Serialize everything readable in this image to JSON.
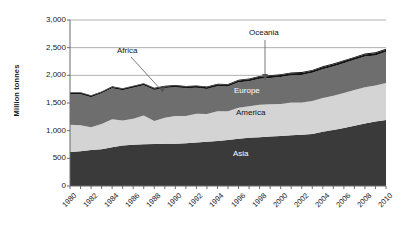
{
  "chart_data": {
    "type": "area",
    "stacked": true,
    "title": "",
    "xlabel": "",
    "ylabel": "Million tonnes",
    "ylim": [
      0,
      3000
    ],
    "ytick_labels": [
      "0",
      "500",
      "1,000",
      "1,500",
      "2,000",
      "2,500",
      "3,000"
    ],
    "ytick_values": [
      0,
      500,
      1000,
      1500,
      2000,
      2500,
      3000
    ],
    "grid": true,
    "grid_axis": "y",
    "legend_position": "inline-labels",
    "x": [
      1980,
      1981,
      1982,
      1983,
      1984,
      1985,
      1986,
      1987,
      1988,
      1989,
      1990,
      1991,
      1992,
      1993,
      1994,
      1995,
      1996,
      1997,
      1998,
      1999,
      2000,
      2001,
      2002,
      2003,
      2004,
      2005,
      2006,
      2007,
      2008,
      2009,
      2010
    ],
    "xtick_labels": [
      "1980",
      "1982",
      "1984",
      "1986",
      "1988",
      "1990",
      "1992",
      "1994",
      "1996",
      "1998",
      "2000",
      "2002",
      "2004",
      "2006",
      "2008",
      "2010"
    ],
    "xtick_values": [
      1980,
      1982,
      1984,
      1986,
      1988,
      1990,
      1992,
      1994,
      1996,
      1998,
      2000,
      2002,
      2004,
      2006,
      2008,
      2010
    ],
    "xlim": [
      1980,
      2010
    ],
    "series": [
      {
        "name": "Asia",
        "color": "#3a3a3a",
        "label_position": "inline",
        "values": [
          615,
          630,
          650,
          665,
          700,
          730,
          745,
          755,
          760,
          762,
          765,
          772,
          785,
          800,
          812,
          830,
          855,
          870,
          880,
          893,
          905,
          918,
          928,
          942,
          980,
          1010,
          1050,
          1090,
          1130,
          1165,
          1195
        ]
      },
      {
        "name": "America",
        "color": "#d4d4d4",
        "label_position": "inline",
        "values": [
          490,
          470,
          410,
          455,
          505,
          455,
          470,
          520,
          415,
          470,
          500,
          495,
          520,
          500,
          540,
          520,
          560,
          570,
          590,
          585,
          575,
          590,
          580,
          595,
          610,
          620,
          630,
          645,
          655,
          650,
          665
        ]
      },
      {
        "name": "Europe",
        "color": "#6e6e6e",
        "label_position": "inline",
        "values": [
          555,
          560,
          545,
          555,
          560,
          545,
          560,
          545,
          560,
          540,
          520,
          500,
          470,
          455,
          450,
          450,
          460,
          455,
          470,
          475,
          490,
          495,
          500,
          510,
          520,
          530,
          540,
          545,
          555,
          545,
          565
        ]
      },
      {
        "name": "Africa",
        "color": "#141414",
        "label_position": "callout",
        "values": [
          24,
          24,
          25,
          25,
          26,
          26,
          27,
          27,
          28,
          28,
          29,
          29,
          30,
          30,
          31,
          31,
          32,
          32,
          33,
          33,
          34,
          34,
          35,
          35,
          36,
          36,
          37,
          37,
          38,
          38,
          39
        ]
      },
      {
        "name": "Oceania",
        "color": "#141414",
        "label_position": "callout",
        "values": [
          10,
          10,
          10,
          10,
          11,
          11,
          11,
          11,
          12,
          12,
          12,
          12,
          13,
          13,
          13,
          13,
          14,
          14,
          14,
          14,
          15,
          15,
          15,
          15,
          16,
          16,
          16,
          16,
          17,
          17,
          17
        ]
      }
    ],
    "annotations": [
      {
        "text": "Africa",
        "x_label": 1120,
        "y_label": 50
      },
      {
        "text": "Oceania",
        "x_label": 252,
        "y_label": 33
      }
    ],
    "inline_labels": [
      {
        "text": "Europe",
        "tone": "light"
      },
      {
        "text": "America",
        "tone": "dark"
      },
      {
        "text": "Asia",
        "tone": "light"
      }
    ]
  },
  "labels": {
    "ylabel": "Million tonnes",
    "africa": "Africa",
    "oceania": "Oceania",
    "europe": "Europe",
    "america": "America",
    "asia": "Asia"
  }
}
